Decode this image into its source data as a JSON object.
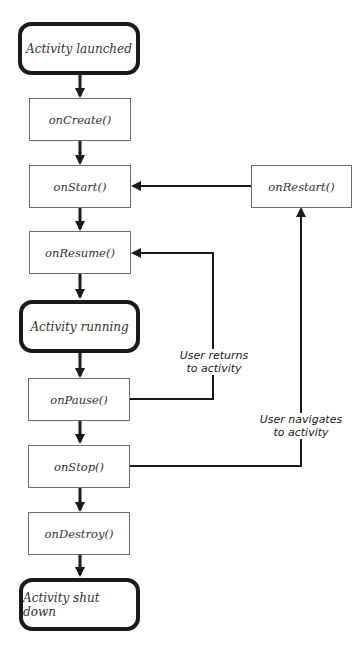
{
  "diagram": {
    "states": {
      "launched": "Activity launched",
      "running": "Activity running",
      "shutdown": "Activity shut down"
    },
    "methods": {
      "onCreate": "onCreate()",
      "onStart": "onStart()",
      "onResume": "onResume()",
      "onPause": "onPause()",
      "onStop": "onStop()",
      "onDestroy": "onDestroy()",
      "onRestart": "onRestart()"
    },
    "edge_labels": {
      "returns_line1": "User returns",
      "returns_line2": "to activity",
      "navigates_line1": "User navigates",
      "navigates_line2": "to activity"
    },
    "colors": {
      "line": "#1a1a1a",
      "box_border": "#6a6a6a",
      "text": "#333333"
    }
  }
}
